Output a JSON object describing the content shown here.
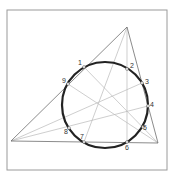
{
  "diagram": {
    "frame": {
      "x": 7,
      "y": 10,
      "w": 160,
      "h": 160
    },
    "triangle": {
      "A": [
        127,
        27
      ],
      "B": [
        11,
        141
      ],
      "C": [
        158,
        143
      ]
    },
    "circle": {
      "cx": 105,
      "cy": 105,
      "r": 43
    },
    "points": [
      {
        "label": "1",
        "x": 84,
        "y": 67,
        "lx": 78,
        "ly": 65
      },
      {
        "label": "2",
        "x": 127,
        "y": 69,
        "lx": 130,
        "ly": 68
      },
      {
        "label": "3",
        "x": 142,
        "y": 83,
        "lx": 145,
        "ly": 84
      },
      {
        "label": "4",
        "x": 148,
        "y": 106,
        "lx": 150,
        "ly": 107
      },
      {
        "label": "5",
        "x": 143,
        "y": 127,
        "lx": 143,
        "ly": 130
      },
      {
        "label": "6",
        "x": 127,
        "y": 142,
        "lx": 125,
        "ly": 150
      },
      {
        "label": "7",
        "x": 84,
        "y": 142,
        "lx": 80,
        "ly": 139
      },
      {
        "label": "8",
        "x": 69,
        "y": 128,
        "lx": 64,
        "ly": 134
      },
      {
        "label": "9",
        "x": 68,
        "y": 84,
        "lx": 62,
        "ly": 83
      }
    ],
    "cevians": [
      {
        "from": [
          127,
          27
        ],
        "to": [
          84,
          142
        ]
      },
      {
        "from": [
          127,
          27
        ],
        "to": [
          127,
          142
        ]
      },
      {
        "from": [
          11,
          141
        ],
        "to": [
          142,
          83
        ]
      },
      {
        "from": [
          11,
          141
        ],
        "to": [
          148,
          106
        ]
      },
      {
        "from": [
          158,
          143
        ],
        "to": [
          84,
          67
        ]
      },
      {
        "from": [
          158,
          143
        ],
        "to": [
          68,
          84
        ]
      }
    ]
  }
}
